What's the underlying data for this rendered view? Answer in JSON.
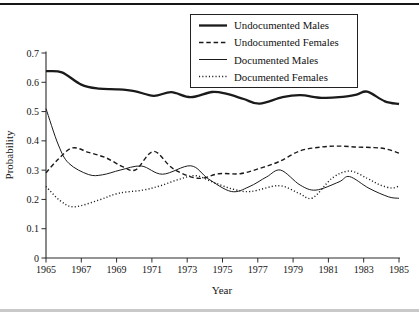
{
  "figure": {
    "top_rule_color": "#161616",
    "bottom_rule_color": "#c9c9c9",
    "line_color": "#1a1a1a",
    "background_color": "#ffffff"
  },
  "chart_data": {
    "type": "line",
    "title": "",
    "xlabel": "Year",
    "ylabel": "Probability",
    "xlim": [
      1965,
      1985
    ],
    "ylim": [
      0,
      0.7
    ],
    "grid": false,
    "legend_position": "top-right",
    "x_ticks": [
      1965,
      1967,
      1969,
      1971,
      1973,
      1975,
      1977,
      1979,
      1981,
      1983,
      1985
    ],
    "x_tick_labels": [
      "1965",
      "1967",
      "1969",
      "1971",
      "1973",
      "1975",
      "1977",
      "1979",
      "1981",
      "1983",
      "1985"
    ],
    "y_ticks": [
      0,
      0.1,
      0.2,
      0.3,
      0.4,
      0.5,
      0.6,
      0.7
    ],
    "y_tick_labels": [
      "0",
      "0.1",
      "0.2",
      "0.3",
      "0.4",
      "0.5",
      "0.6",
      "0.7"
    ],
    "series": [
      {
        "name": "Undocumented Males",
        "style": "solid-thick",
        "points": [
          [
            1965,
            0.638
          ],
          [
            1965.9,
            0.634
          ],
          [
            1967,
            0.592
          ],
          [
            1968,
            0.578
          ],
          [
            1969,
            0.576
          ],
          [
            1970,
            0.57
          ],
          [
            1971.1,
            0.554
          ],
          [
            1972.1,
            0.566
          ],
          [
            1973.2,
            0.549
          ],
          [
            1974.4,
            0.567
          ],
          [
            1975.2,
            0.561
          ],
          [
            1976.2,
            0.543
          ],
          [
            1977.1,
            0.527
          ],
          [
            1978.4,
            0.549
          ],
          [
            1979.4,
            0.556
          ],
          [
            1980.6,
            0.547
          ],
          [
            1981.6,
            0.549
          ],
          [
            1982.6,
            0.558
          ],
          [
            1983.2,
            0.568
          ],
          [
            1984.2,
            0.535
          ],
          [
            1985,
            0.526
          ]
        ]
      },
      {
        "name": "Undocumented Females",
        "style": "dashed",
        "points": [
          [
            1965,
            0.291
          ],
          [
            1965.7,
            0.338
          ],
          [
            1966.5,
            0.376
          ],
          [
            1967.4,
            0.361
          ],
          [
            1968.4,
            0.342
          ],
          [
            1969.4,
            0.31
          ],
          [
            1970.1,
            0.302
          ],
          [
            1971.1,
            0.364
          ],
          [
            1972.2,
            0.305
          ],
          [
            1973.6,
            0.272
          ],
          [
            1974.8,
            0.288
          ],
          [
            1976,
            0.288
          ],
          [
            1977.1,
            0.306
          ],
          [
            1978.2,
            0.329
          ],
          [
            1979.4,
            0.366
          ],
          [
            1980.6,
            0.379
          ],
          [
            1981.6,
            0.382
          ],
          [
            1982.6,
            0.379
          ],
          [
            1983.6,
            0.377
          ],
          [
            1984.3,
            0.372
          ],
          [
            1985,
            0.358
          ]
        ]
      },
      {
        "name": "Documented Males",
        "style": "solid-thin",
        "points": [
          [
            1965,
            0.51
          ],
          [
            1965.7,
            0.386
          ],
          [
            1966.3,
            0.323
          ],
          [
            1967.4,
            0.285
          ],
          [
            1968.2,
            0.284
          ],
          [
            1969.2,
            0.3
          ],
          [
            1970.4,
            0.314
          ],
          [
            1971.6,
            0.286
          ],
          [
            1973.2,
            0.315
          ],
          [
            1974.2,
            0.27
          ],
          [
            1975.5,
            0.227
          ],
          [
            1976.5,
            0.243
          ],
          [
            1977.5,
            0.277
          ],
          [
            1978.3,
            0.3
          ],
          [
            1979.4,
            0.249
          ],
          [
            1980.3,
            0.232
          ],
          [
            1981.6,
            0.26
          ],
          [
            1982.2,
            0.278
          ],
          [
            1983.3,
            0.238
          ],
          [
            1984.4,
            0.209
          ],
          [
            1985,
            0.204
          ]
        ]
      },
      {
        "name": "Documented Females",
        "style": "dotted",
        "points": [
          [
            1965,
            0.244
          ],
          [
            1965.8,
            0.196
          ],
          [
            1966.6,
            0.175
          ],
          [
            1968,
            0.198
          ],
          [
            1969.1,
            0.221
          ],
          [
            1970.5,
            0.232
          ],
          [
            1971.5,
            0.247
          ],
          [
            1972.5,
            0.268
          ],
          [
            1973.5,
            0.281
          ],
          [
            1974.5,
            0.258
          ],
          [
            1975.6,
            0.235
          ],
          [
            1976.6,
            0.227
          ],
          [
            1978.2,
            0.247
          ],
          [
            1979.3,
            0.222
          ],
          [
            1980.1,
            0.205
          ],
          [
            1981.2,
            0.272
          ],
          [
            1982.2,
            0.297
          ],
          [
            1983.2,
            0.272
          ],
          [
            1983.9,
            0.25
          ],
          [
            1984.6,
            0.239
          ],
          [
            1985,
            0.246
          ]
        ]
      }
    ]
  }
}
